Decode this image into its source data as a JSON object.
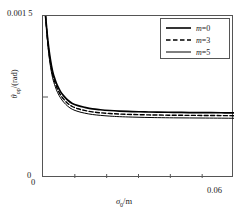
{
  "chart_data": {
    "type": "line",
    "title": "",
    "xlabel": "σ₀/m",
    "ylabel": "θop/(rad)",
    "xlim": [
      0,
      0.06
    ],
    "ylim": [
      0,
      0.0015
    ],
    "xticks": [
      "0",
      "0.06"
    ],
    "yticks": [
      "0",
      "0.001 5"
    ],
    "grid": false,
    "legend_position": "top-right",
    "series": [
      {
        "name": "m=0",
        "style": "solid",
        "x": [
          0.0008,
          0.0015,
          0.0022,
          0.003,
          0.0038,
          0.0046,
          0.0055,
          0.0065,
          0.0078,
          0.0092,
          0.011,
          0.013,
          0.0155,
          0.018,
          0.021,
          0.024,
          0.028,
          0.032,
          0.036,
          0.041,
          0.046,
          0.051,
          0.056,
          0.06
        ],
        "y": [
          0.0015,
          0.00128,
          0.00112,
          0.00099,
          0.00091,
          0.00085,
          0.0008,
          0.00076,
          0.00072,
          0.00069,
          0.00067,
          0.000655,
          0.00064,
          0.000632,
          0.000625,
          0.00062,
          0.000615,
          0.000612,
          0.00061,
          0.000608,
          0.000606,
          0.000605,
          0.000604,
          0.000603
        ]
      },
      {
        "name": "m=3",
        "style": "dashed",
        "x": [
          0.0008,
          0.0015,
          0.0022,
          0.003,
          0.0038,
          0.0046,
          0.0055,
          0.0065,
          0.0078,
          0.0092,
          0.011,
          0.013,
          0.0155,
          0.018,
          0.021,
          0.024,
          0.028,
          0.032,
          0.036,
          0.041,
          0.046,
          0.051,
          0.056,
          0.06
        ],
        "y": [
          0.0015,
          0.00126,
          0.00109,
          0.00096,
          0.00088,
          0.00082,
          0.00077,
          0.00073,
          0.00069,
          0.000662,
          0.000641,
          0.000626,
          0.000612,
          0.000604,
          0.000597,
          0.000592,
          0.000588,
          0.000585,
          0.000583,
          0.000581,
          0.00058,
          0.000579,
          0.000578,
          0.000577
        ]
      },
      {
        "name": "m=5",
        "style": "solid",
        "x": [
          0.0008,
          0.0015,
          0.0022,
          0.003,
          0.0038,
          0.0046,
          0.0055,
          0.0065,
          0.0078,
          0.0092,
          0.011,
          0.013,
          0.0155,
          0.018,
          0.021,
          0.024,
          0.028,
          0.032,
          0.036,
          0.041,
          0.046,
          0.051,
          0.056,
          0.06
        ],
        "y": [
          0.0015,
          0.00124,
          0.00106,
          0.00093,
          0.00085,
          0.00079,
          0.000742,
          0.000702,
          0.000664,
          0.000636,
          0.000616,
          0.000601,
          0.000588,
          0.00058,
          0.000573,
          0.000568,
          0.000564,
          0.000561,
          0.000559,
          0.000557,
          0.000556,
          0.000555,
          0.000554,
          0.000553
        ]
      }
    ]
  },
  "axes": {
    "y_max_label": "0.001 5",
    "y_min_label": "0",
    "x_min_label": "0",
    "x_max_label": "0.06",
    "y_title_symbol": "θ",
    "y_title_sub": "op",
    "y_title_unit": "/(rad)",
    "x_title_symbol": "σ",
    "x_title_sub": "0",
    "x_title_unit": "/m"
  },
  "legend": {
    "entries": [
      {
        "label": "m=0",
        "symbol": "m",
        "value": "=0",
        "style": "solid"
      },
      {
        "label": "m=3",
        "symbol": "m",
        "value": "=3",
        "style": "dashed"
      },
      {
        "label": "m=5",
        "symbol": "m",
        "value": "=5",
        "style": "solid"
      }
    ]
  },
  "colors": {
    "line": "#000000",
    "frame": "#555555",
    "background": "#ffffff"
  }
}
